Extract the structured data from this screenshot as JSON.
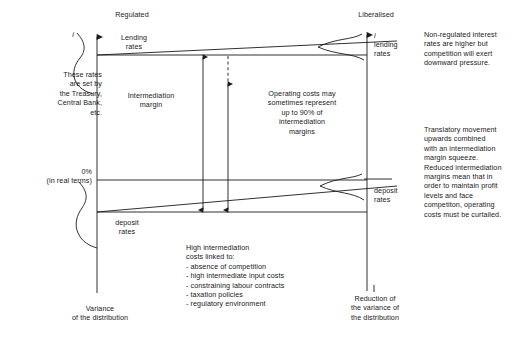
{
  "diagram": {
    "title_left": "Regulated",
    "title_right": "Liberalised",
    "axis_symbol_left": "i",
    "axis_symbol_right": "i",
    "lending_rates_left": "Lending\nrates",
    "lending_rates_right": "lending\nrates",
    "deposit_rates_left": "deposit\nrates",
    "deposit_rates_right": "deposit\nrates",
    "intermediation_margin": "Intermediation\nmargin",
    "operating_costs": "Operating costs may\nsometimes represent\nup to 90% of\nintermediation\nmargins",
    "zero_label": "0%",
    "real_terms_label": "(in real terms)",
    "left_note": "These rates\nare set by\nthe Treasury,\nCentral Bank,\netc.",
    "note_top_right": "Non-regulated interest\nrates are higher but\ncompetition will exert\ndownward pressure.",
    "note_mid_right": "Translatory movement\nupwards combined\nwith an intermediation\nmargin squeeze.\nReduced intermediation\nmargins mean that in\norder to maintain profit\nlevels and face\ncompetiton, operating\ncosts must be curtailed.",
    "bottom_list": "High intermediation\ncosts linked to:\n  - absence of competition\n  - high intermediate input costs\n  - constraining labour contracts\n  - taxation policies\n  - regulatory environment",
    "variance_left": "Variance\nof the distribution",
    "variance_right": "Reduction of\nthe variance of\nthe distribution",
    "stroke_color": "#1a1a1a",
    "background_color": "#ffffff"
  }
}
